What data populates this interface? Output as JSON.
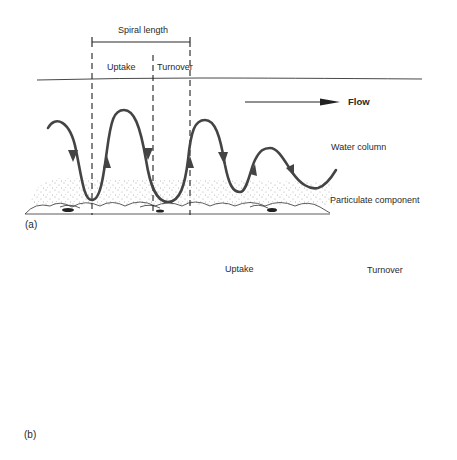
{
  "panel_a": {
    "label": "(a)",
    "spiral_length_label": "Spiral length",
    "uptake_label": "Uptake",
    "turnover_label": "Turnover",
    "flow_label": "Flow",
    "water_column_label": "Water column",
    "particulate_label": "Particulate component"
  },
  "panel_b": {
    "label": "(b)",
    "uptake_label": "Uptake",
    "turnover_label": "Turnover"
  },
  "colors": {
    "ink": "#2a2a2a",
    "curve": "#444444",
    "background": "#ffffff"
  }
}
